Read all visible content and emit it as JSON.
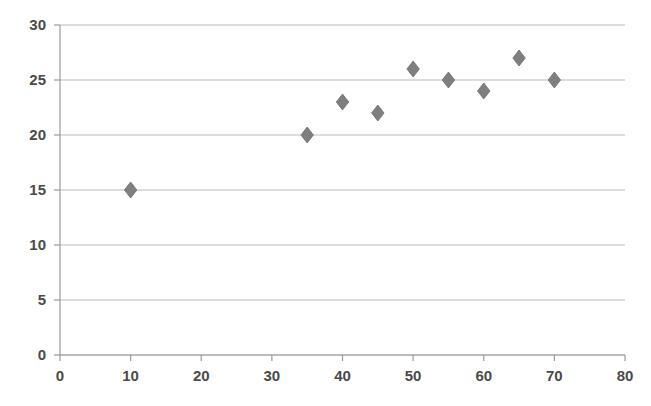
{
  "chart_data": {
    "type": "scatter",
    "title": "",
    "subtitle": "",
    "xlabel": "",
    "ylabel": "",
    "xlim": [
      0,
      80
    ],
    "ylim": [
      0,
      30
    ],
    "xticks": [
      0,
      10,
      20,
      30,
      40,
      50,
      60,
      70,
      80
    ],
    "yticks": [
      0,
      5,
      10,
      15,
      20,
      25,
      30
    ],
    "xtick_labels": [
      "0",
      "10",
      "20",
      "30",
      "40",
      "50",
      "60",
      "70",
      "80"
    ],
    "ytick_labels": [
      "0",
      "5",
      "10",
      "15",
      "20",
      "25",
      "30"
    ],
    "grid": "horizontal",
    "legend": "none",
    "marker_shape": "diamond",
    "marker_color": "#7f7f7f",
    "gridline_color": "#b9b9b9",
    "axis_color": "#9a9a9a",
    "tick_label_color": "#4a4a4a",
    "background_color": "#ffffff",
    "series": [
      {
        "name": "series-1",
        "points": [
          {
            "x": 10,
            "y": 15
          },
          {
            "x": 35,
            "y": 20
          },
          {
            "x": 40,
            "y": 23
          },
          {
            "x": 45,
            "y": 22
          },
          {
            "x": 50,
            "y": 26
          },
          {
            "x": 55,
            "y": 25
          },
          {
            "x": 60,
            "y": 24
          },
          {
            "x": 65,
            "y": 27
          },
          {
            "x": 70,
            "y": 25
          }
        ]
      }
    ],
    "x": [
      10,
      35,
      40,
      45,
      50,
      55,
      60,
      65,
      70
    ],
    "values": [
      15,
      20,
      23,
      22,
      26,
      25,
      24,
      27,
      25
    ]
  }
}
